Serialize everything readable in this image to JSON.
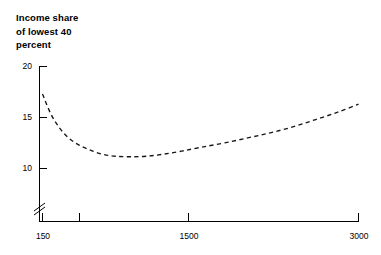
{
  "chart_data": {
    "type": "line",
    "title": "Income share\nof lowest 40\npercent",
    "title_lines": [
      "Income share",
      "of lowest 40",
      "percent"
    ],
    "xlabel": "",
    "ylabel": "Income share of lowest 40 percent",
    "ylim": [
      8.8,
      20.6
    ],
    "yticks": [
      20,
      15,
      10
    ],
    "ytick_labels": [
      "20",
      "15",
      "10"
    ],
    "xticks": [
      150,
      300,
      1500,
      3000
    ],
    "xtick_labels": [
      "150",
      "",
      "1500",
      "3000"
    ],
    "xscale": "log",
    "xlim": [
      150,
      3000
    ],
    "grid": false,
    "legend": null,
    "y_axis_break": true,
    "linestyle": "dashed",
    "series": [
      {
        "name": "Income share of lowest 40 percent",
        "x": [
          150,
          162,
          176,
          192,
          212,
          236,
          265,
          300,
          345,
          400,
          470,
          560,
          680,
          840,
          1050,
          1300,
          1620,
          2000,
          2450,
          3000
        ],
        "values": [
          17.3,
          15.4,
          14.0,
          13.0,
          12.3,
          11.8,
          11.4,
          11.2,
          11.15,
          11.2,
          11.4,
          11.7,
          12.1,
          12.5,
          13.0,
          13.5,
          14.1,
          14.8,
          15.5,
          16.3
        ]
      }
    ],
    "annotations": []
  },
  "axes": {
    "y_tick_marks": 3,
    "x_tick_marks": 4,
    "axis_color": "#000000"
  }
}
